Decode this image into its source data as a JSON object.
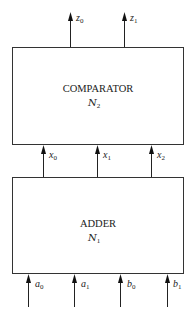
{
  "diagram": {
    "blocks": [
      {
        "id": "comparator",
        "title": "COMPARATOR",
        "symbol": "N",
        "symbol_sub": "2"
      },
      {
        "id": "adder",
        "title": "ADDER",
        "symbol": "N",
        "symbol_sub": "1"
      }
    ],
    "outputs": [
      {
        "name": "z",
        "sub": "0"
      },
      {
        "name": "z",
        "sub": "1"
      }
    ],
    "intermediate": [
      {
        "name": "x",
        "sub": "0"
      },
      {
        "name": "x",
        "sub": "1"
      },
      {
        "name": "x",
        "sub": "2"
      }
    ],
    "inputs": [
      {
        "name": "a",
        "sub": "0"
      },
      {
        "name": "a",
        "sub": "1"
      },
      {
        "name": "b",
        "sub": "0"
      },
      {
        "name": "b",
        "sub": "1"
      }
    ],
    "colors": {
      "line": "#222222",
      "background": "#ffffff"
    }
  }
}
